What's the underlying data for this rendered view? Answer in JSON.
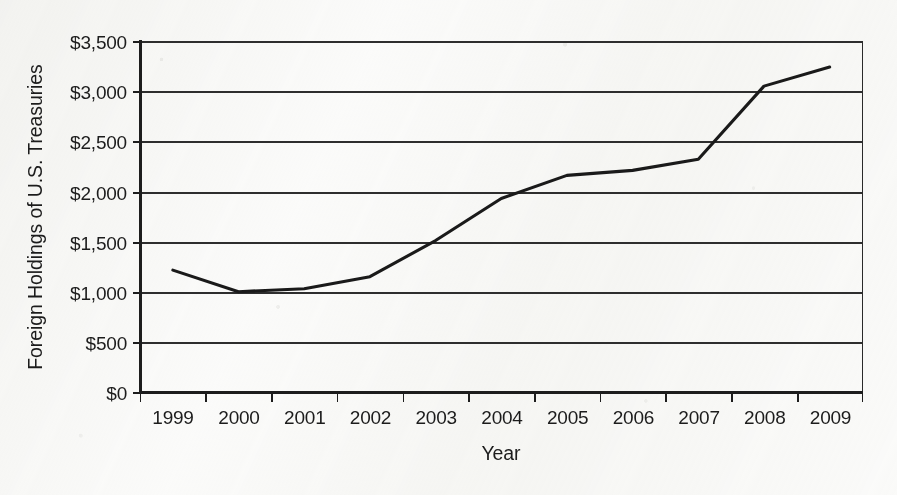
{
  "chart_data": {
    "type": "line",
    "title": "",
    "xlabel": "Year",
    "ylabel": "Foreign Holdings of U.S. Treasuries",
    "categories": [
      "1999",
      "2000",
      "2001",
      "2002",
      "2003",
      "2004",
      "2005",
      "2006",
      "2007",
      "2008",
      "2009"
    ],
    "series": [
      {
        "name": "Foreign Holdings of U.S. Treasuries",
        "values": [
          1225,
          1010,
          1040,
          1160,
          1520,
          1940,
          2170,
          2220,
          2330,
          3060,
          3250
        ],
        "color": "#1a1a1a"
      }
    ],
    "ylim": [
      0,
      3500
    ],
    "y_tick_values": [
      0,
      500,
      1000,
      1500,
      2000,
      2500,
      3000,
      3500
    ],
    "y_tick_labels": [
      "$0",
      "$500",
      "$1,000",
      "$1,500",
      "$2,000",
      "$2,500",
      "$3,000",
      "$3,500"
    ],
    "x_tick_labels": [
      "1999",
      "2000",
      "2001",
      "2002",
      "2003",
      "2004",
      "2005",
      "2006",
      "2007",
      "2008",
      "2009"
    ],
    "grid": "horizontal",
    "legend": "none",
    "background_color": "#fbfbfa",
    "axis_color": "#1d1d1d",
    "gridline_color": "#2e2e2e"
  }
}
